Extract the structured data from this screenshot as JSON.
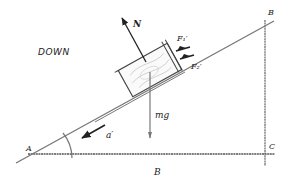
{
  "diagram": {
    "type": "inclined-plane-free-body-diagram",
    "direction_label": "DOWN",
    "vertices": {
      "A": "A",
      "B_top": "B",
      "C": "C",
      "B_base": "B"
    },
    "forces": {
      "normal": "N",
      "weight": "mg",
      "f1": "F₁′",
      "f2": "F₂′"
    },
    "angle_label": "α",
    "acceleration_label": "a′",
    "colors": {
      "line": "#555555",
      "arrow": "#222222",
      "label": "#222222",
      "background": "#ffffff"
    }
  }
}
